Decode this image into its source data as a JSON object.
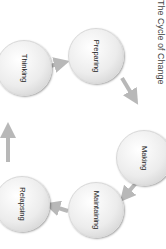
{
  "title": "The Cycle of Change",
  "nodes": [
    {
      "label": "Preparing"
    },
    {
      "label": "Making"
    },
    {
      "label": "Maintaining"
    },
    {
      "label": "Relapsing"
    },
    {
      "label": "Thinking"
    }
  ],
  "colors": {
    "arrow": "#b8b8b8",
    "node": "#e8e8e8",
    "text": "#222222"
  }
}
